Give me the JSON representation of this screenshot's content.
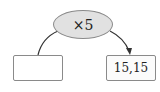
{
  "diagram": {
    "operator": {
      "label": "×5",
      "shape": "ellipse",
      "fill": "#e1e1e1"
    },
    "input_box": {
      "value": ""
    },
    "output_box": {
      "value": "15,15"
    },
    "arrows": [
      {
        "from": "input_box",
        "to": "operator",
        "arrowhead": false
      },
      {
        "from": "operator",
        "to": "output_box",
        "arrowhead": true
      }
    ]
  }
}
